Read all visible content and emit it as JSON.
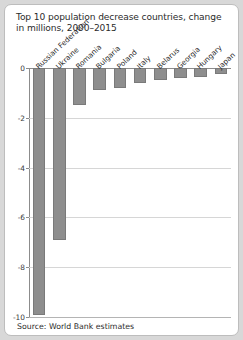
{
  "chart_data": {
    "type": "bar",
    "title": "Top 10 population decrease countries, change in millions, 2000–2015",
    "xlabel": "",
    "ylabel": "",
    "categories": [
      "Russian Federation",
      "Ukraine",
      "Romania",
      "Bulgaria",
      "Poland",
      "Italy",
      "Belarus",
      "Georgia",
      "Hungary",
      "Japan"
    ],
    "values": [
      -9.9,
      -6.9,
      -1.5,
      -0.9,
      -0.8,
      -0.6,
      -0.5,
      -0.4,
      -0.35,
      -0.25
    ],
    "ylim": [
      -10,
      0
    ],
    "yticks": [
      0,
      -2,
      -4,
      -6,
      -8,
      -10
    ],
    "ytick_labels": [
      "0",
      "-2",
      "-4",
      "-6",
      "-8",
      "-10"
    ],
    "grid": true,
    "legend": "none",
    "bar_color": "#8e8e8e"
  },
  "source": "Source: World Bank estimates"
}
